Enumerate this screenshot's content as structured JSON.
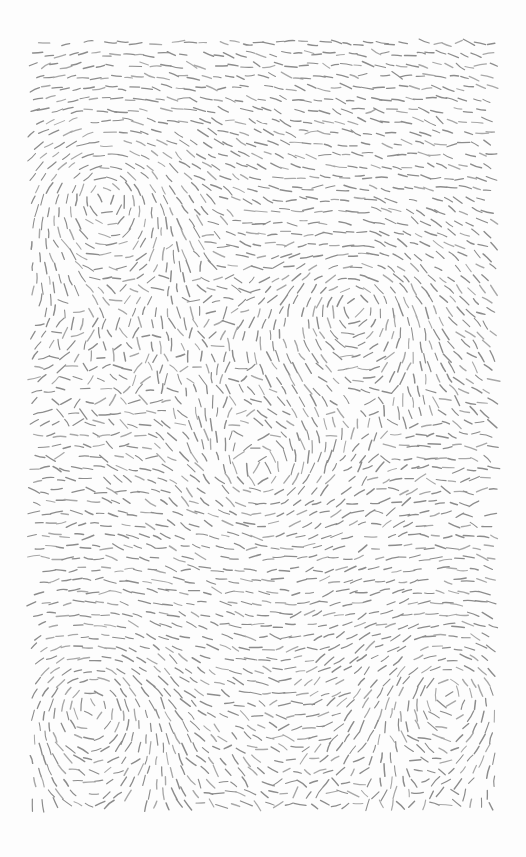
{
  "artwork": {
    "title": "Flow Field Dash Study",
    "medium": "generative-vector-field-hatching",
    "canvas": {
      "width": 526,
      "height": 857,
      "background_color": "#fdfdfd",
      "paper_color": "#ffffff"
    },
    "plot_area": {
      "left": 33,
      "top": 43,
      "right": 493,
      "bottom": 813,
      "width": 460,
      "height": 770
    },
    "stroke": {
      "color": "#8c8c8c",
      "color_light": "#a8a8a8",
      "width": 1.25,
      "dash_length": 10,
      "linecap": "round"
    },
    "grid": {
      "spacing_x": 11.2,
      "spacing_y": 11.2,
      "jitter": 2.2,
      "columns": 42,
      "rows": 70
    },
    "field": {
      "type": "sum-of-vortices-plus-noise",
      "base_angle_deg": 0,
      "noise_scale": 0.0075,
      "noise_amplitude_deg": 68,
      "vortices": [
        {
          "id": "vortex-top-left",
          "cx": 104,
          "cy": 193,
          "strength": 1.0,
          "spin": 1,
          "radius": 165
        },
        {
          "id": "vortex-mid-right",
          "cx": 356,
          "cy": 305,
          "strength": 0.82,
          "spin": 1,
          "radius": 150
        },
        {
          "id": "vortex-bottom-left",
          "cx": 90,
          "cy": 703,
          "strength": 0.95,
          "spin": 1,
          "radius": 160
        },
        {
          "id": "vortex-bottom-right",
          "cx": 448,
          "cy": 690,
          "strength": 0.88,
          "spin": 1,
          "radius": 150
        },
        {
          "id": "saddle-center",
          "cx": 262,
          "cy": 480,
          "strength": 0.45,
          "spin": -1,
          "radius": 190
        }
      ]
    },
    "seed": 20240517
  }
}
